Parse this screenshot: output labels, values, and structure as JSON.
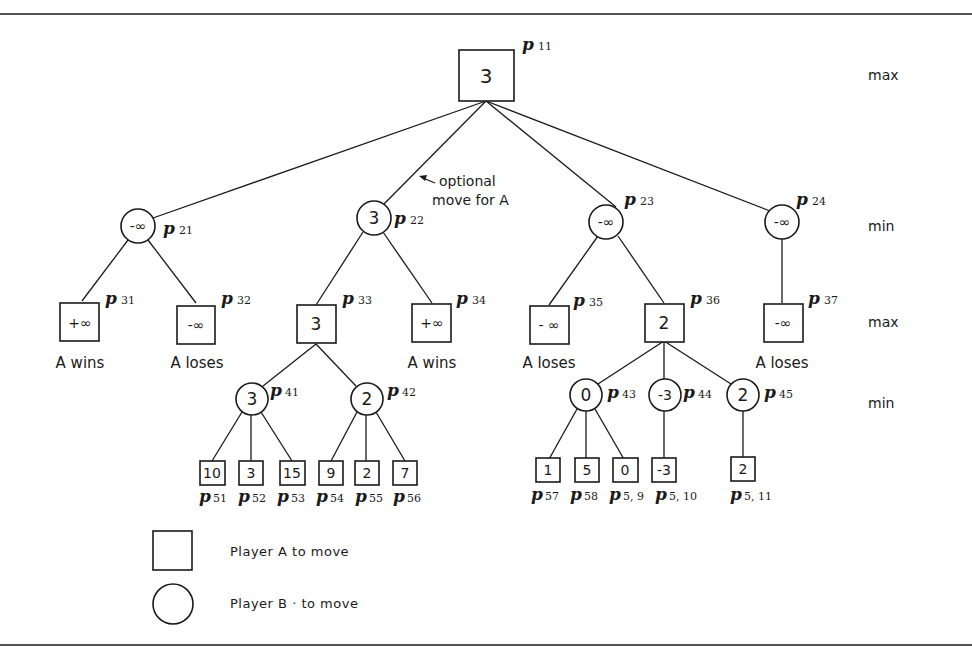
{
  "figure": {
    "levels": [
      {
        "label": "max",
        "y": 78
      },
      {
        "label": "min",
        "y": 229
      },
      {
        "label": "max",
        "y": 325
      },
      {
        "label": "min",
        "y": 406
      }
    ],
    "annotation": {
      "line1": "optional",
      "line2": "move for A"
    },
    "nodes": {
      "p11": {
        "value": "3",
        "name": "p",
        "sub": "11",
        "shape": "square"
      },
      "p21": {
        "value": "-∞",
        "name": "p",
        "sub": "21",
        "shape": "circle"
      },
      "p22": {
        "value": "3",
        "name": "p",
        "sub": "22",
        "shape": "circle"
      },
      "p23": {
        "value": "-∞",
        "name": "p",
        "sub": "23",
        "shape": "circle"
      },
      "p24": {
        "value": "-∞",
        "name": "p",
        "sub": "24",
        "shape": "circle"
      },
      "p31": {
        "value": "+∞",
        "name": "p",
        "sub": "31",
        "shape": "square",
        "outcome": "A wins"
      },
      "p32": {
        "value": "-∞",
        "name": "p",
        "sub": "32",
        "shape": "square",
        "outcome": "A loses"
      },
      "p33": {
        "value": "3",
        "name": "p",
        "sub": "33",
        "shape": "square"
      },
      "p34": {
        "value": "+∞",
        "name": "p",
        "sub": "34",
        "shape": "square",
        "outcome": "A wins"
      },
      "p35": {
        "value": "- ∞",
        "name": "p",
        "sub": "35",
        "shape": "square",
        "outcome": "A loses"
      },
      "p36": {
        "value": "2",
        "name": "p",
        "sub": "36",
        "shape": "square"
      },
      "p37": {
        "value": "-∞",
        "name": "p",
        "sub": "37",
        "shape": "square",
        "outcome": "A loses"
      },
      "p41": {
        "value": "3",
        "name": "p",
        "sub": "41",
        "shape": "circle"
      },
      "p42": {
        "value": "2",
        "name": "p",
        "sub": "42",
        "shape": "circle"
      },
      "p43": {
        "value": "0",
        "name": "p",
        "sub": "43",
        "shape": "circle"
      },
      "p44": {
        "value": "-3",
        "name": "p",
        "sub": "44",
        "shape": "circle"
      },
      "p45": {
        "value": "2",
        "name": "p",
        "sub": "45",
        "shape": "circle"
      },
      "p51": {
        "value": "10",
        "name": "p",
        "sub": "51",
        "shape": "square"
      },
      "p52": {
        "value": "3",
        "name": "p",
        "sub": "52",
        "shape": "square"
      },
      "p53": {
        "value": "15",
        "name": "p",
        "sub": "53",
        "shape": "square"
      },
      "p54": {
        "value": "9",
        "name": "p",
        "sub": "54",
        "shape": "square"
      },
      "p55": {
        "value": "2",
        "name": "p",
        "sub": "55",
        "shape": "square"
      },
      "p56": {
        "value": "7",
        "name": "p",
        "sub": "56",
        "shape": "square"
      },
      "p57": {
        "value": "1",
        "name": "p",
        "sub": "57",
        "shape": "square"
      },
      "p58": {
        "value": "5",
        "name": "p",
        "sub": "58",
        "shape": "square"
      },
      "p59": {
        "value": "0",
        "name": "p",
        "sub": "5, 9",
        "shape": "square"
      },
      "p510": {
        "value": "-3",
        "name": "p",
        "sub": "5, 10",
        "shape": "square"
      },
      "p511": {
        "value": "2",
        "name": "p",
        "sub": "5, 11",
        "shape": "square"
      }
    },
    "edges": [
      [
        "p11",
        "p21"
      ],
      [
        "p11",
        "p22"
      ],
      [
        "p11",
        "p23"
      ],
      [
        "p11",
        "p24"
      ],
      [
        "p21",
        "p31"
      ],
      [
        "p21",
        "p32"
      ],
      [
        "p22",
        "p33"
      ],
      [
        "p22",
        "p34"
      ],
      [
        "p23",
        "p35"
      ],
      [
        "p23",
        "p36"
      ],
      [
        "p24",
        "p37"
      ],
      [
        "p33",
        "p41"
      ],
      [
        "p33",
        "p42"
      ],
      [
        "p36",
        "p43"
      ],
      [
        "p36",
        "p44"
      ],
      [
        "p36",
        "p45"
      ],
      [
        "p41",
        "p51"
      ],
      [
        "p41",
        "p52"
      ],
      [
        "p41",
        "p53"
      ],
      [
        "p42",
        "p54"
      ],
      [
        "p42",
        "p55"
      ],
      [
        "p42",
        "p56"
      ],
      [
        "p43",
        "p57"
      ],
      [
        "p43",
        "p58"
      ],
      [
        "p43",
        "p59"
      ],
      [
        "p44",
        "p510"
      ],
      [
        "p45",
        "p511"
      ]
    ],
    "legend": {
      "square": "Player  A  to  move",
      "circle": "Player  B · to  move"
    }
  }
}
